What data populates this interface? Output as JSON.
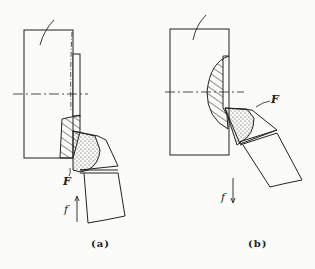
{
  "figure": {
    "panels": [
      {
        "id": "a",
        "caption": "(a)",
        "force_label": "F",
        "feed_label": "f",
        "feed_direction": "up"
      },
      {
        "id": "b",
        "caption": "(b)",
        "force_label": "F",
        "feed_direction": "down",
        "feed_label": "f"
      }
    ],
    "colors": {
      "line": "#222222",
      "background": "#fbfbfa"
    }
  }
}
